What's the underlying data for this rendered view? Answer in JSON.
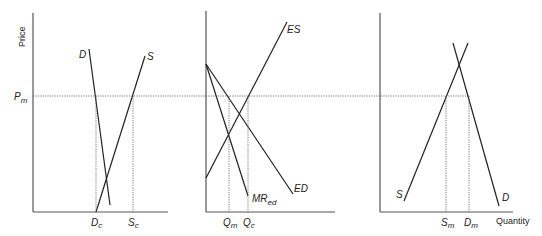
{
  "figure": {
    "y_axis_label": "Price",
    "x_axis_label": "Quantity",
    "price_level": {
      "label": "P",
      "sub": "m"
    }
  },
  "panels": [
    {
      "name": "home-market",
      "curves": [
        {
          "label": "D",
          "sub": ""
        },
        {
          "label": "S",
          "sub": ""
        }
      ],
      "ticks": [
        {
          "label": "D",
          "sub": "c"
        },
        {
          "label": "S",
          "sub": "c"
        }
      ]
    },
    {
      "name": "international-market",
      "curves": [
        {
          "label": "ES",
          "sub": ""
        },
        {
          "label": "ED",
          "sub": ""
        },
        {
          "label": "MR",
          "sub": "ed"
        }
      ],
      "ticks": [
        {
          "label": "Q",
          "sub": "m"
        },
        {
          "label": "Q",
          "sub": "c"
        }
      ]
    },
    {
      "name": "foreign-market",
      "curves": [
        {
          "label": "S",
          "sub": ""
        },
        {
          "label": "D",
          "sub": ""
        }
      ],
      "ticks": [
        {
          "label": "S",
          "sub": "m"
        },
        {
          "label": "D",
          "sub": "m"
        }
      ]
    }
  ]
}
